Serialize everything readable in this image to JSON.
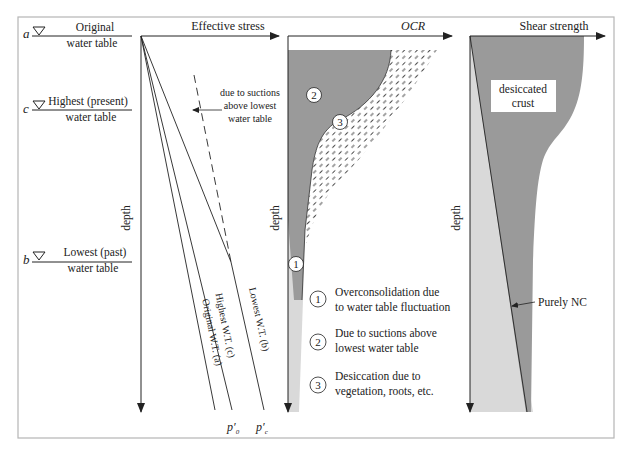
{
  "diagram": {
    "panels": {
      "water_tables": {
        "labels": [
          {
            "letter": "a",
            "line1": "Original",
            "line2": "water table"
          },
          {
            "letter": "c",
            "line1": "Highest (present)",
            "line2": "water table"
          },
          {
            "letter": "b",
            "line1": "Lowest (past)",
            "line2": "water table"
          }
        ]
      },
      "effective_stress": {
        "x_axis_label": "Effective stress",
        "y_axis_label": "depth",
        "annotation": [
          "due to suctions",
          "above lowest",
          "water table"
        ],
        "line_labels": {
          "original": "Original W.T. (a)",
          "highest": "Highest W.T. (c)",
          "lowest": "Lowest W.T. (b)"
        },
        "end_labels": {
          "p0": "p′",
          "p0_sub": "0",
          "pc": "p′",
          "pc_sub": "c"
        }
      },
      "ocr": {
        "x_axis_label": "OCR",
        "y_axis_label": "depth",
        "zone_markers": [
          "1",
          "2",
          "3"
        ],
        "legend": [
          {
            "marker": "1",
            "line1": "Overconsolidation due",
            "line2": "to water table fluctuation"
          },
          {
            "marker": "2",
            "line1": "Due to suctions above",
            "line2": "lowest water table"
          },
          {
            "marker": "3",
            "line1": "Desiccation due to",
            "line2": "vegetation, roots, etc."
          }
        ]
      },
      "shear_strength": {
        "x_axis_label": "Shear strength",
        "y_axis_label": "depth",
        "crust_label": [
          "desiccated",
          "crust"
        ],
        "nc_label": "Purely NC"
      }
    },
    "colors": {
      "dark_fill": "#9a9a9a",
      "light_fill": "#d9d9d9",
      "line": "#222222",
      "frame": "#b5b5b5"
    }
  }
}
